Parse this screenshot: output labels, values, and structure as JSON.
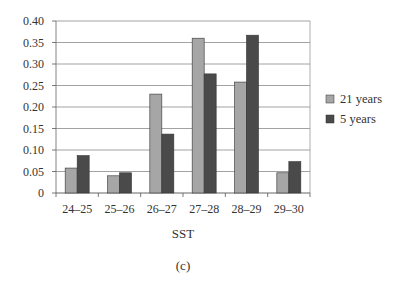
{
  "chart_data": {
    "type": "bar",
    "title": "",
    "xlabel": "SST",
    "ylabel": "",
    "caption": "(c)",
    "categories": [
      "24–25",
      "25–26",
      "26–27",
      "27–28",
      "28–29",
      "29–30"
    ],
    "series": [
      {
        "name": "21 years",
        "color": "#a6a6a6",
        "values": [
          0.058,
          0.04,
          0.23,
          0.36,
          0.258,
          0.047
        ]
      },
      {
        "name": "5 years",
        "color": "#4a4a4a",
        "values": [
          0.087,
          0.047,
          0.137,
          0.277,
          0.367,
          0.073
        ]
      }
    ],
    "ylim": [
      0,
      0.4
    ],
    "yticks": [
      "0",
      "0.05",
      "0.10",
      "0.15",
      "0.20",
      "0.25",
      "0.30",
      "0.35",
      "0.40"
    ],
    "grid": true,
    "legend_position": "right"
  }
}
